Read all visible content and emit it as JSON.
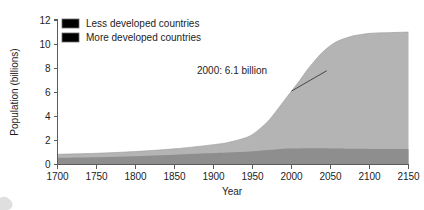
{
  "figure": {
    "name": "world-population-growth",
    "background_color": "#ffffff"
  },
  "chart_data": {
    "type": "area",
    "title": "",
    "subtitle": "",
    "xlabel": "Year",
    "ylabel": "Population (billions)",
    "xlim": [
      1700,
      2150
    ],
    "ylim": [
      0,
      12
    ],
    "xticks": [
      1700,
      1750,
      1800,
      1850,
      1900,
      1950,
      2000,
      2050,
      2100,
      2150
    ],
    "yticks": [
      0,
      2,
      4,
      6,
      8,
      10,
      12
    ],
    "xtick_labels": [
      "1700",
      "1750",
      "1800",
      "1850",
      "1900",
      "1950",
      "2000",
      "2050",
      "2100",
      "2150"
    ],
    "ytick_labels": [
      "0",
      "2",
      "4",
      "6",
      "8",
      "10",
      "12"
    ],
    "grid": false,
    "stacked": true,
    "legend_position": "top-left",
    "x": [
      1700,
      1750,
      1800,
      1850,
      1900,
      1920,
      1940,
      1950,
      1960,
      1970,
      1980,
      1990,
      2000,
      2010,
      2020,
      2030,
      2040,
      2050,
      2060,
      2070,
      2080,
      2090,
      2100,
      2110,
      2120,
      2130,
      2140,
      2150
    ],
    "series": [
      {
        "name": "More developed countries",
        "color": "#8e8e8e",
        "values": [
          0.55,
          0.6,
          0.68,
          0.8,
          0.95,
          1.0,
          1.05,
          1.1,
          1.15,
          1.2,
          1.25,
          1.3,
          1.32,
          1.33,
          1.34,
          1.34,
          1.34,
          1.33,
          1.32,
          1.31,
          1.3,
          1.3,
          1.29,
          1.29,
          1.28,
          1.28,
          1.28,
          1.28
        ]
      },
      {
        "name": "Less developed countries",
        "color": "#b4b4b4",
        "values": [
          0.3,
          0.33,
          0.4,
          0.5,
          0.7,
          0.85,
          1.15,
          1.4,
          1.85,
          2.4,
          3.15,
          3.95,
          4.78,
          5.6,
          6.5,
          7.3,
          8.0,
          8.55,
          8.95,
          9.2,
          9.4,
          9.5,
          9.6,
          9.64,
          9.66,
          9.68,
          9.7,
          9.72
        ]
      }
    ],
    "totals": [
      0.85,
      0.93,
      1.08,
      1.3,
      1.65,
      1.85,
      2.2,
      2.5,
      3.0,
      3.6,
      4.4,
      5.25,
      6.1,
      6.93,
      7.84,
      8.64,
      9.34,
      9.88,
      10.27,
      10.51,
      10.7,
      10.8,
      10.89,
      10.93,
      10.94,
      10.96,
      10.98,
      11.0
    ],
    "annotations": [
      {
        "text": "2000: 6.1 billion",
        "x": 2000,
        "y": 6.1,
        "label_x": 1940,
        "label_y": 7.95
      }
    ],
    "legend": [
      {
        "label": "Less developed countries",
        "color": "#b4b4b4"
      },
      {
        "label": "More developed countries",
        "color": "#8e8e8e"
      }
    ]
  }
}
